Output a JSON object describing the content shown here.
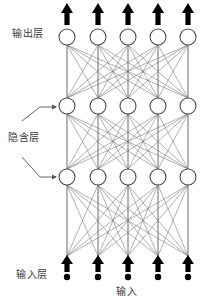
{
  "diagram": {
    "kind": "neural-network-architecture",
    "background_color": "#ffffff",
    "node_stroke_color": "#4a4a4a",
    "node_fill_color": "#ffffff",
    "edge_color": "#6b6b6b",
    "skip_line_color": "#a8a8a8",
    "arrow_color": "#000000",
    "pointer_color": "#555555",
    "labels": {
      "output_layer": "输出层",
      "hidden_layer": "隐含层",
      "input_layer": "输入层",
      "input_bottom": "输入"
    },
    "layers": [
      {
        "name": "output-layer",
        "node_count": 5,
        "y": 37,
        "node_radius": 8
      },
      {
        "name": "hidden-layer-1",
        "node_count": 5,
        "y": 106,
        "node_radius": 8
      },
      {
        "name": "hidden-layer-2",
        "node_count": 5,
        "y": 177,
        "node_radius": 8
      },
      {
        "name": "input-layer",
        "node_count": 5,
        "y": 272,
        "node_radius": 3
      }
    ],
    "columns_x": [
      67,
      98,
      128,
      158,
      188
    ],
    "output_arrows": {
      "count": 5,
      "y_tip": 4,
      "y_base": 24,
      "direction": "up"
    },
    "input_arrows": {
      "count": 5,
      "y_tip": 256,
      "y_base": 272,
      "direction": "up"
    },
    "pointer_arrows": [
      {
        "name": "pointer-to-hidden-1",
        "x1": 22,
        "y1": 121,
        "x2": 58,
        "y2": 106
      },
      {
        "name": "pointer-to-hidden-2",
        "x1": 22,
        "y1": 158,
        "x2": 58,
        "y2": 177
      }
    ],
    "skip_lines": {
      "description": "vertical lines from input row up to output row at each column",
      "y_top": 45,
      "y_bottom": 256
    }
  }
}
